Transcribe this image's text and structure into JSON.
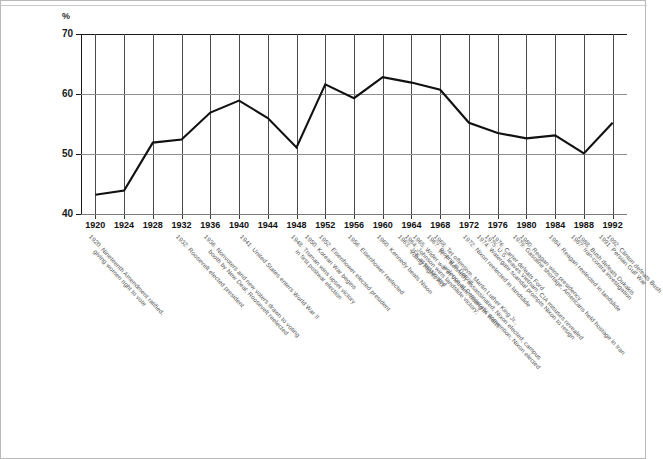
{
  "chart_data": {
    "type": "line",
    "title": "",
    "subtitle": "",
    "xlabel": "",
    "ylabel": "%",
    "ylim": [
      40,
      70
    ],
    "xlim": [
      1920,
      1992
    ],
    "y_ticks": [
      40,
      50,
      60,
      70
    ],
    "gridlines": {
      "horizontal": [
        50,
        60
      ],
      "vertical_every_category": true
    },
    "legend": "none",
    "categories": [
      1920,
      1924,
      1928,
      1932,
      1936,
      1940,
      1944,
      1948,
      1952,
      1956,
      1960,
      1964,
      1968,
      1972,
      1976,
      1980,
      1984,
      1988,
      1992
    ],
    "values": [
      43.2,
      43.9,
      51.9,
      52.4,
      56.9,
      58.9,
      56.0,
      51.1,
      61.6,
      59.3,
      62.8,
      61.9,
      60.7,
      55.2,
      53.5,
      52.6,
      53.1,
      50.1,
      55.2
    ],
    "series": [
      {
        "name": "Voter turnout",
        "values": [
          43.2,
          43.9,
          51.9,
          52.4,
          56.9,
          58.9,
          56.0,
          51.1,
          61.6,
          59.3,
          62.8,
          61.9,
          60.7,
          55.2,
          53.5,
          52.6,
          53.1,
          50.1,
          55.2
        ]
      }
    ],
    "annotations": [
      {
        "year": 1920,
        "lines": [
          "1920: Nineteenth Amendment ratified,",
          "giving women right to vote"
        ]
      },
      {
        "year": 1932,
        "lines": [
          "1932: Roosevelt elected president"
        ]
      },
      {
        "year": 1936,
        "lines": [
          "1936: Nonvoters and new voters drawn to voting",
          "booth by New Deal; Roosevelt reelected"
        ]
      },
      {
        "year": 1941,
        "lines": [
          "1941: United States enters World War II"
        ]
      },
      {
        "year": 1948,
        "lines": [
          "1948: Truman wins upset victory",
          "in first postwar election"
        ]
      },
      {
        "year": 1950,
        "lines": [
          "1950: Korean War begins"
        ]
      },
      {
        "year": 1952,
        "lines": [
          "1952: Eisenhower elected president"
        ]
      },
      {
        "year": 1956,
        "lines": [
          "1956: Eisenhower reelected"
        ]
      },
      {
        "year": 1960,
        "lines": [
          "1960: Kennedy beats Nixon"
        ]
      },
      {
        "year": 1963,
        "lines": [
          "1963: JFK assassinated"
        ]
      },
      {
        "year": 1964,
        "lines": [
          "1964: Johnson wins landslide victory;",
          "Voting Rights Act"
        ]
      },
      {
        "year": 1965,
        "lines": [
          "1965: Wider war in Vietnam; rioting in Watts"
        ]
      },
      {
        "year": 1967,
        "lines": [
          "1967: Rioting in Detroit"
        ]
      },
      {
        "year": 1968,
        "lines": [
          "1968: Tet offensive, Martin Luther King Jr.,",
          "R. F. Kennedy assassinated; Nixon elected; campus",
          "violence at Democratic convention; Nixon elected"
        ]
      },
      {
        "year": 1972,
        "lines": [
          "1972: Nixon reelected in landslide"
        ]
      },
      {
        "year": 1974,
        "lines": [
          "1974: Watergate scandal prompts Nixon to resign"
        ]
      },
      {
        "year": 1975,
        "lines": [
          "1975: U.S. leaves Vietnam; CIA misuses revealed"
        ]
      },
      {
        "year": 1976,
        "lines": [
          "1976: Carter defeats Ford"
        ]
      },
      {
        "year": 1979,
        "lines": [
          "1979: Gasoline shortage; Americans held hostage in Iran"
        ]
      },
      {
        "year": 1980,
        "lines": [
          "1980: Reagan wins presidency"
        ]
      },
      {
        "year": 1984,
        "lines": [
          "1984: Reagan reelected in landslide"
        ]
      },
      {
        "year": 1987,
        "lines": [
          "1987: Iran-contra investigation"
        ]
      },
      {
        "year": 1988,
        "lines": [
          "1988: Bush defeats Dukakis"
        ]
      },
      {
        "year": 1991,
        "lines": [
          "1991: Persian Gulf War"
        ]
      },
      {
        "year": 1992,
        "lines": [
          "1992: Clinton defeats Bush"
        ]
      }
    ]
  },
  "axis": {
    "y_unit_label": "%",
    "y_tick_labels": [
      "70",
      "60",
      "50",
      "40"
    ],
    "x_tick_labels": [
      "1920",
      "1924",
      "1928",
      "1932",
      "1936",
      "1940",
      "1944",
      "1948",
      "1952",
      "1956",
      "1960",
      "1964",
      "1968",
      "1972",
      "1976",
      "1980",
      "1984",
      "1988",
      "1992"
    ]
  },
  "colors": {
    "line": "#111111",
    "grid_vertical": "#4a4a4a",
    "grid_horizontal": "#8d8d8d",
    "axis": "#1a1a1a",
    "annotation_text": "#565656",
    "frame": "#b9b9b9",
    "background": "#ffffff"
  }
}
